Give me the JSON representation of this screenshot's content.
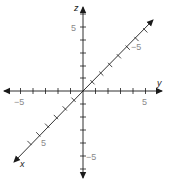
{
  "diagram": {
    "type": "3d-coordinate-axes",
    "colors": {
      "axis": "#1a1a1a",
      "tick_label": "#8a8a8a",
      "axis_label": "#222222",
      "background": "#ffffff"
    },
    "axes": {
      "x": {
        "label": "x",
        "direction": "diagonal toward lower-left",
        "range": [
          -5,
          5
        ],
        "labeled_ticks": [
          {
            "value": 5,
            "text": "5"
          }
        ]
      },
      "y": {
        "label": "y",
        "direction": "horizontal to the right",
        "range": [
          -5,
          5
        ],
        "labeled_ticks": [
          {
            "value": -5,
            "text": "−5"
          },
          {
            "value": 5,
            "text": "5"
          }
        ]
      },
      "z": {
        "label": "z",
        "direction": "vertical upward",
        "range": [
          -5,
          5
        ],
        "labeled_ticks": [
          {
            "value": 5,
            "text": "5"
          },
          {
            "value": -5,
            "text": "−5"
          }
        ]
      }
    },
    "diagonal_negative_x_label": "−5"
  }
}
